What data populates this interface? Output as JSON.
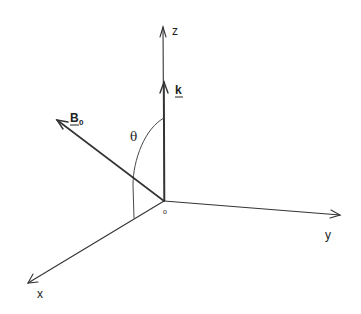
{
  "diagram": {
    "type": "3d-coordinate-axes",
    "colors": {
      "line": "#333333",
      "text": "#222222",
      "background": "#ffffff"
    },
    "origin": {
      "label": "o",
      "x": 164,
      "y": 201
    },
    "axes": [
      {
        "name": "x",
        "label": "x",
        "end": [
          28,
          283
        ]
      },
      {
        "name": "y",
        "label": "y",
        "end": [
          340,
          215
        ]
      },
      {
        "name": "z",
        "label": "z",
        "end": [
          163,
          27
        ]
      }
    ],
    "vectors": [
      {
        "name": "k",
        "label": "k",
        "underlined": true,
        "end": [
          164,
          82
        ]
      },
      {
        "name": "B0",
        "label": "B",
        "subscript": "0",
        "underlined": true,
        "end": [
          57,
          120
        ]
      }
    ],
    "angle": {
      "label": "θ",
      "between": [
        "k",
        "B0"
      ]
    }
  }
}
